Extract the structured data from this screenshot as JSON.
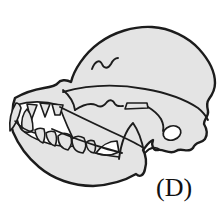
{
  "figure": {
    "label": "(D)",
    "type": "illustration"
  },
  "icons": {
    "main_graphic": "dog-skull-illustration"
  },
  "colors": {
    "background": "#ffffff",
    "bone_fill": "#e4e4e4",
    "outline": "#1c1c1c",
    "mouth_gap": "#ffffff",
    "label_text": "#111111"
  }
}
